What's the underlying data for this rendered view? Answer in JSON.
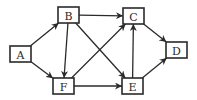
{
  "diagram": {
    "type": "directed-graph",
    "colors": {
      "stroke": "#2a2a2a",
      "background": "#ffffff"
    },
    "nodes": [
      {
        "id": "A",
        "label": "A",
        "x": 10,
        "y": 46,
        "w": 21,
        "h": 16
      },
      {
        "id": "B",
        "label": "B",
        "x": 58,
        "y": 7,
        "w": 21,
        "h": 16
      },
      {
        "id": "C",
        "label": "C",
        "x": 123,
        "y": 8,
        "w": 21,
        "h": 16
      },
      {
        "id": "D",
        "label": "D",
        "x": 166,
        "y": 42,
        "w": 21,
        "h": 16
      },
      {
        "id": "E",
        "label": "E",
        "x": 122,
        "y": 78,
        "w": 21,
        "h": 16
      },
      {
        "id": "F",
        "label": "F",
        "x": 53,
        "y": 78,
        "w": 21,
        "h": 16
      }
    ],
    "edges": [
      {
        "from": "A",
        "to": "B"
      },
      {
        "from": "A",
        "to": "F"
      },
      {
        "from": "B",
        "to": "C"
      },
      {
        "from": "B",
        "to": "F"
      },
      {
        "from": "B",
        "to": "E"
      },
      {
        "from": "F",
        "to": "C"
      },
      {
        "from": "F",
        "to": "E"
      },
      {
        "from": "E",
        "to": "C"
      },
      {
        "from": "C",
        "to": "D"
      },
      {
        "from": "E",
        "to": "D"
      }
    ]
  }
}
